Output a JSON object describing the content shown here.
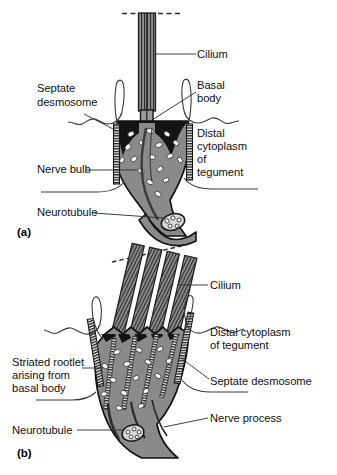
{
  "figure": {
    "background_color": "#ffffff",
    "ink_color": "#101010",
    "cytoplasm_fill": "#8a8a8a",
    "membrane_dark": "#1a1a1a",
    "vesicle_fill": "#ffffff"
  },
  "panels": [
    {
      "tag": "(a)",
      "name": "single-ciliated-nerve-bulb",
      "labels": [
        {
          "id": "cilium_a",
          "text": "Cilium",
          "side": "right"
        },
        {
          "id": "basal_body_a",
          "line1": "Basal",
          "line2": "body",
          "side": "right"
        },
        {
          "id": "distal_cyto_a",
          "line1": "Distal",
          "line2": "cytoplasm",
          "line3": "of",
          "line4": "tegument",
          "side": "right"
        },
        {
          "id": "septate_desmosome_a",
          "line1": "Septate",
          "line2": "desmosome",
          "side": "left"
        },
        {
          "id": "nerve_bulb_a",
          "text": "Nerve bulb",
          "side": "left"
        },
        {
          "id": "neurotubule_a",
          "text": "Neurotubule",
          "side": "left"
        }
      ]
    },
    {
      "tag": "(b)",
      "name": "multiciliated-nerve-process",
      "labels": [
        {
          "id": "cilium_b",
          "text": "Cilium",
          "side": "right"
        },
        {
          "id": "distal_cyto_b",
          "line1": "Distal cytoplasm",
          "line2": "of tegument",
          "side": "right"
        },
        {
          "id": "septate_desmosome_b",
          "text": "Septate desmosome",
          "side": "right"
        },
        {
          "id": "nerve_process_b",
          "text": "Nerve process",
          "side": "right"
        },
        {
          "id": "striated_rootlet_b",
          "line1": "Striated rootlet",
          "line2": "arising from",
          "line3": "basal body",
          "side": "left"
        },
        {
          "id": "neurotubule_b",
          "text": "Neurotubule",
          "side": "left"
        }
      ]
    }
  ],
  "text": {
    "a": {
      "tag": "(a)",
      "cilium": "Cilium",
      "basal_body_l1": "Basal",
      "basal_body_l2": "body",
      "distal_l1": "Distal",
      "distal_l2": "cytoplasm",
      "distal_l3": "of",
      "distal_l4": "tegument",
      "septate_l1": "Septate",
      "septate_l2": "desmosome",
      "nerve_bulb": "Nerve bulb",
      "neurotubule": "Neurotubule"
    },
    "b": {
      "tag": "(b)",
      "cilium": "Cilium",
      "distal_l1": "Distal cytoplasm",
      "distal_l2": "of tegument",
      "septate": "Septate desmosome",
      "nerve_process": "Nerve process",
      "rootlet_l1": "Striated rootlet",
      "rootlet_l2": "arising from",
      "rootlet_l3": "basal body",
      "neurotubule": "Neurotubule"
    }
  }
}
